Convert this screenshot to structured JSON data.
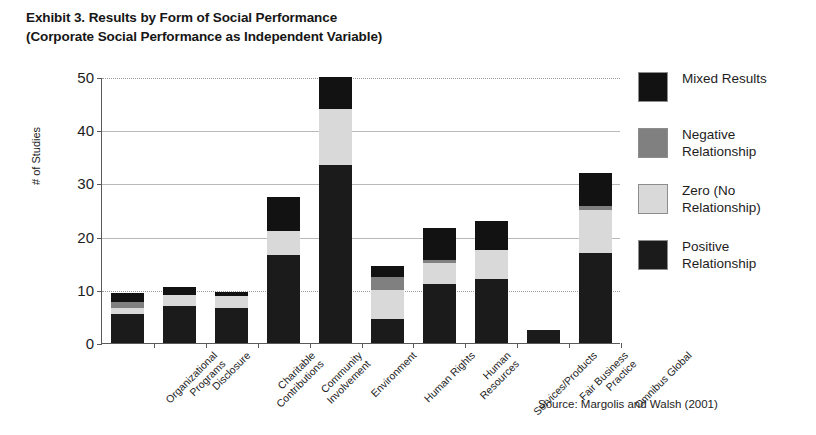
{
  "title": {
    "line1": "Exhibit 3. Results by Form of Social Performance",
    "line2": "(Corporate Social Performance as Independent Variable)"
  },
  "source": "Source: Margolis and Walsh (2001)",
  "legend": {
    "position": "right",
    "items": [
      {
        "label_line1": "Mixed Results",
        "label_line2": "",
        "color": "#121212",
        "key": "mixed"
      },
      {
        "label_line1": "Negative",
        "label_line2": "Relationship",
        "color": "#808080",
        "key": "negative"
      },
      {
        "label_line1": "Zero (No",
        "label_line2": "Relationship)",
        "color": "#d9d9d9",
        "key": "zero"
      },
      {
        "label_line1": "Positive",
        "label_line2": "Relationship",
        "color": "#1b1b1b",
        "key": "positive"
      }
    ]
  },
  "yaxis": {
    "label": "# of Studies",
    "ticks": [
      "0",
      "10",
      "20",
      "30",
      "40",
      "50"
    ],
    "min": 0,
    "max": 50
  },
  "chart_data": {
    "type": "bar",
    "subtype": "stacked-vertical",
    "title": "Exhibit 3. Results by Form of Social Performance (Corporate Social Performance as Independent Variable)",
    "xlabel": "",
    "ylabel": "# of Studies",
    "ylim": [
      0,
      50
    ],
    "yticks": [
      0,
      10,
      20,
      30,
      40,
      50
    ],
    "grid": true,
    "legend_position": "right",
    "categories": [
      "Organizational Programs",
      "Disclosure",
      "Charitable Contributions",
      "Community Involvement",
      "Environment",
      "Human Rights",
      "Human Resources",
      "Services/Products",
      "Fair Business Practice",
      "Omnibus Global"
    ],
    "category_lines": [
      [
        "Organizational",
        "Programs"
      ],
      [
        "Disclosure",
        ""
      ],
      [
        "Charitable",
        "Contributions"
      ],
      [
        "Community",
        "Involvement"
      ],
      [
        "Environment",
        ""
      ],
      [
        "Human Rights",
        ""
      ],
      [
        "Human",
        "Resources"
      ],
      [
        "Services/Products",
        ""
      ],
      [
        "Fair Business",
        "Practice"
      ],
      [
        "Omnibus Global",
        ""
      ]
    ],
    "series": [
      {
        "name": "Positive Relationship",
        "color": "#1b1b1b",
        "key": "positive",
        "values": [
          5.5,
          7.0,
          6.5,
          16.5,
          33.5,
          4.5,
          11.0,
          12.0,
          2.5,
          17.0
        ]
      },
      {
        "name": "Zero (No Relationship)",
        "color": "#d9d9d9",
        "key": "zero",
        "values": [
          1.0,
          2.0,
          2.3,
          4.5,
          10.5,
          5.5,
          4.0,
          5.5,
          0.0,
          8.0
        ]
      },
      {
        "name": "Negative Relationship",
        "color": "#808080",
        "key": "negative",
        "values": [
          1.2,
          0.0,
          0.0,
          0.0,
          0.0,
          2.5,
          0.7,
          0.0,
          0.0,
          0.8
        ]
      },
      {
        "name": "Mixed Results",
        "color": "#121212",
        "key": "mixed",
        "values": [
          1.8,
          1.5,
          0.7,
          6.5,
          6.0,
          2.0,
          6.0,
          5.5,
          0.0,
          6.2
        ]
      }
    ],
    "totals": [
      9.5,
      10.5,
      9.5,
      27.5,
      50.0,
      14.5,
      21.7,
      23.0,
      2.5,
      32.0
    ]
  }
}
